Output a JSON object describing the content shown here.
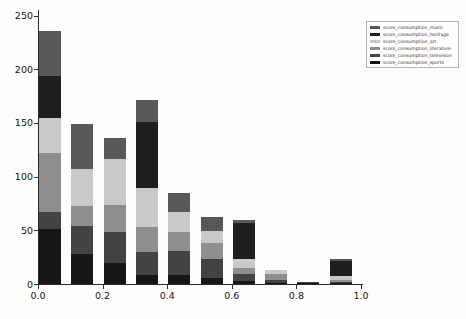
{
  "chart_data": {
    "type": "bar",
    "stacked": true,
    "title": "",
    "xlabel": "",
    "ylabel": "",
    "grid": false,
    "ylim": [
      0,
      250
    ],
    "y_ticks": [
      0,
      50,
      100,
      150,
      200,
      250
    ],
    "x_ticks": [
      "0.0",
      "0.2",
      "0.4",
      "0.6",
      "0.8",
      "1.0"
    ],
    "categories": [
      "0.0-0.1",
      "0.1-0.2",
      "0.2-0.3",
      "0.3-0.4",
      "0.4-0.5",
      "0.5-0.6",
      "0.6-0.7",
      "0.7-0.8",
      "0.8-0.9",
      "0.9-1.0"
    ],
    "series": [
      {
        "name": "score_consumption_sports",
        "color": "#161616",
        "values": [
          51,
          28,
          20,
          8,
          8,
          6,
          3,
          1,
          1,
          1
        ]
      },
      {
        "name": "score_consumption_television",
        "color": "#434343",
        "values": [
          16,
          26,
          28,
          22,
          23,
          17,
          6,
          3,
          1,
          1
        ]
      },
      {
        "name": "score_consumption_literature",
        "color": "#8e8e8e",
        "values": [
          55,
          19,
          26,
          23,
          17,
          15,
          6,
          5,
          0,
          2
        ]
      },
      {
        "name": "score_consumption_art",
        "color": "#c9c9c9",
        "values": [
          33,
          34,
          42,
          36,
          19,
          11,
          8,
          4,
          0,
          3
        ]
      },
      {
        "name": "score_consumption_heritage",
        "color": "#1e1e1e",
        "values": [
          39,
          0,
          0,
          62,
          0,
          0,
          34,
          0,
          0,
          14
        ]
      },
      {
        "name": "score_consumption_music",
        "color": "#585858",
        "values": [
          42,
          42,
          20,
          20,
          18,
          13,
          3,
          0,
          0,
          2
        ]
      }
    ],
    "totals": [
      236,
      149,
      136,
      171,
      85,
      62,
      60,
      13,
      2,
      23
    ],
    "legend": {
      "position": "upper-right",
      "labels": [
        "score_consumption_music",
        "score_consumption_heritage",
        "score_consumption_art",
        "score_consumption_literature",
        "score_consumption_television",
        "score_consumption_sports"
      ]
    }
  }
}
